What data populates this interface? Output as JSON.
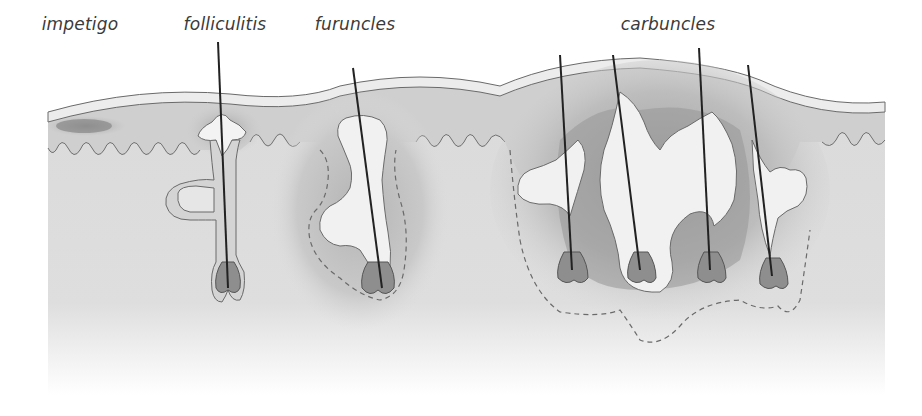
{
  "figure": {
    "labels": [
      {
        "id": "impetigo",
        "text": "impetigo",
        "x": 80,
        "y": 14
      },
      {
        "id": "folliculitis",
        "text": "folliculitis",
        "x": 225,
        "y": 14
      },
      {
        "id": "furuncles",
        "text": "furuncles",
        "x": 355,
        "y": 14
      },
      {
        "id": "carbuncles",
        "text": "carbuncles",
        "x": 668,
        "y": 14
      }
    ],
    "colors": {
      "background": "#ffffff",
      "dermis": "#dcdcdc",
      "epidermis": "#e9e9e9",
      "inflamed": "#a9a9a9",
      "pus": "#efefef",
      "outline": "#6a6a6a",
      "hair": "#222222",
      "bulb": "#8e8e8e"
    }
  }
}
